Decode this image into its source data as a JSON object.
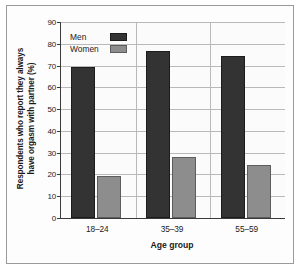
{
  "chart_data": {
    "type": "bar",
    "title": "",
    "subtitle": "",
    "categories": [
      "18–24",
      "35–39",
      "55–59"
    ],
    "series": [
      {
        "name": "Men",
        "values": [
          69.5,
          76.5,
          74.5
        ],
        "color": "#333333"
      },
      {
        "name": "Women",
        "values": [
          19.5,
          28.0,
          24.5
        ],
        "color": "#8d8d8d"
      }
    ],
    "xlabel": "Age group",
    "ylabel": "Respondents who report they always\nhave orgasm with partner (%)",
    "ylim": [
      0,
      90
    ],
    "ytick_step": 10,
    "yticks": [
      "90",
      "80",
      "70",
      "60",
      "50",
      "40",
      "30",
      "20",
      "10",
      "0"
    ],
    "grid": "horizontal-and-group-separators",
    "legend_position": "top-left-inside",
    "legend": [
      {
        "label": "Men",
        "swatch": "men"
      },
      {
        "label": "Women",
        "swatch": "women"
      }
    ],
    "annotations": []
  }
}
